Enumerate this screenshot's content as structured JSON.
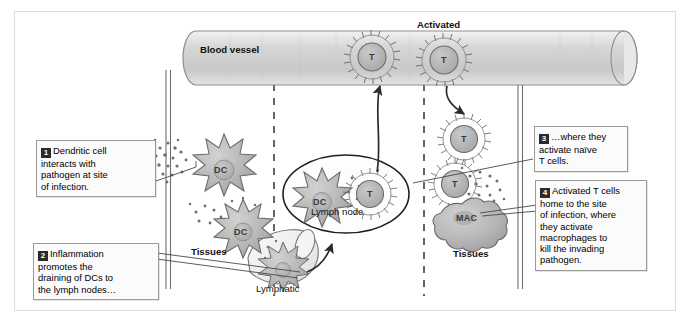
{
  "figure": {
    "frame_color": "#dedede",
    "cell_fill": "#b9b9b9",
    "vessel_fill": "#d3d3d3"
  },
  "structures": {
    "blood_vessel_label": "Blood vessel",
    "lymph_node_label": "Lymph node",
    "lymphatic_label": "Lymphatic",
    "tissues_left_label": "Tissues",
    "tissues_right_label": "Tissues",
    "activated_label": "Activated"
  },
  "cells": {
    "dc_upper_left": "DC",
    "dc_lower_left": "DC",
    "dc_lymphatic": "",
    "dc_lymph_node": "DC",
    "t_lymph_node": "T",
    "t_vessel_left": "T",
    "t_vessel_right": "T",
    "t_tissue_right": "T",
    "t_effector": "T",
    "macrophage": "MAC"
  },
  "callouts": [
    {
      "number": "1",
      "text": "Dendritic cell interacts with pathogen at site of infection.",
      "lines": [
        "Dendritic cell",
        "interacts with",
        "pathogen at site",
        "of infection."
      ]
    },
    {
      "number": "2",
      "text": "Inflammation promotes the draining of DCs to the lymph nodes…",
      "lines": [
        "Inflammation",
        "promotes the",
        "draining of DCs to",
        "the lymph nodes…"
      ]
    },
    {
      "number": "3",
      "text": "…where they activate naïve T cells.",
      "lines": [
        "…where they",
        "activate naïve",
        "T cells."
      ]
    },
    {
      "number": "4",
      "text": "Activated T cells home to the site of infection, where they activate macrophages to kill the invading pathogen.",
      "lines": [
        "Activated T cells",
        "home to the site",
        "of infection, where",
        "they activate",
        "macrophages to",
        "kill the invading",
        "pathogen."
      ]
    }
  ]
}
